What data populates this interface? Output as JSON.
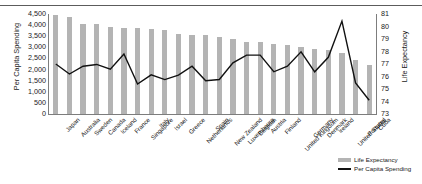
{
  "chart_data": {
    "type": "bar",
    "title": "",
    "subtitle": "",
    "xlabel": "",
    "ylabel": "Per Capita Spending",
    "ylabel_right": "Life Expectancy",
    "ylim": [
      0,
      4500
    ],
    "ylim_right": [
      73,
      81
    ],
    "grid": false,
    "legend_position": "bottom-right",
    "categories": [
      "Japan",
      "Australia",
      "Sweden",
      "Canada",
      "Iceland",
      "France",
      "Singapore",
      "Italy",
      "Israel",
      "Greece",
      "Netherlands",
      "Spain",
      "New Zealand",
      "Luxembourg",
      "Belgium",
      "Austria",
      "Finland",
      "United Kingdom",
      "Germany",
      "Denmark",
      "Ireland",
      "United States",
      "Portugal",
      "Cuba"
    ],
    "yticks_left": [
      "0",
      "500",
      "1,000",
      "1,500",
      "2,000",
      "2,500",
      "3,000",
      "3,500",
      "4,000",
      "4,500"
    ],
    "yticks_right": [
      "73",
      "74",
      "75",
      "76",
      "77",
      "78",
      "79",
      "80",
      "81"
    ],
    "series": [
      {
        "name": "Life Expectancy",
        "type": "bar",
        "axis": "right",
        "color": "#b4b4b4",
        "values": [
          80.9,
          80.8,
          80.2,
          80.2,
          80.0,
          79.9,
          79.9,
          79.8,
          79.7,
          79.4,
          79.3,
          79.3,
          79.2,
          79.0,
          78.8,
          78.8,
          78.6,
          78.5,
          78.4,
          78.2,
          78.1,
          77.9,
          77.3,
          76.9
        ]
      },
      {
        "name": "Per Capita Spending",
        "type": "line",
        "axis": "left",
        "color": "#111111",
        "values": [
          2249,
          1799,
          2150,
          2230,
          2020,
          2700,
          1350,
          1760,
          1550,
          1750,
          2150,
          1500,
          1550,
          2300,
          2650,
          2650,
          1900,
          2150,
          2800,
          1900,
          2550,
          4180,
          1400,
          620
        ]
      }
    ]
  },
  "legend": {
    "items": [
      {
        "label": "Life Expectancy",
        "marker": "swatch-bar"
      },
      {
        "label": "Per Capita Spending",
        "marker": "swatch-line"
      }
    ]
  }
}
